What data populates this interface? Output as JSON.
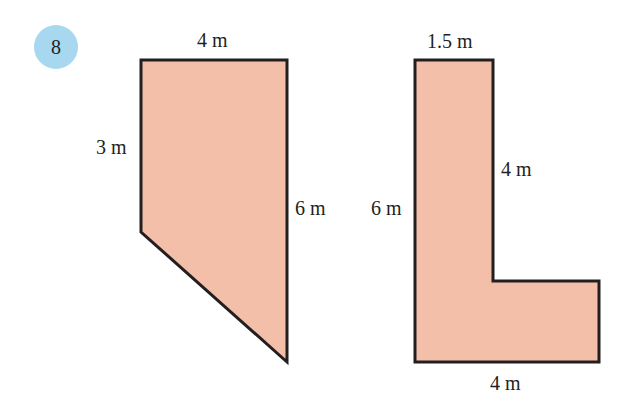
{
  "question_number": "8",
  "colors": {
    "fill": "#f4bfa8",
    "stroke": "#231f20",
    "badge": "#a8d8f0"
  },
  "shape_a": {
    "type": "trapezium",
    "labels": {
      "top": "4 m",
      "left": "3 m",
      "right": "6 m"
    }
  },
  "shape_b": {
    "type": "L-shape",
    "labels": {
      "top": "1.5 m",
      "inner_vertical": "4 m",
      "left": "6 m",
      "bottom": "4 m"
    }
  }
}
